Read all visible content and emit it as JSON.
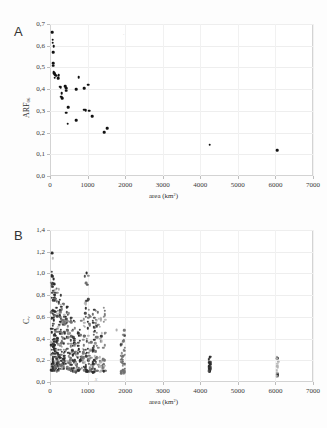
{
  "figure": {
    "background": "#fdfdfd",
    "panel_a_letter": "A",
    "panel_b_letter": "B"
  },
  "chart_data": [
    {
      "type": "scatter",
      "panel": "A",
      "title": "",
      "xlabel": "area (km²)",
      "ylabel": "ARF06",
      "ylabel_base": "ARF",
      "ylabel_sub": "06",
      "xlim": [
        0,
        7000
      ],
      "ylim": [
        0.0,
        0.7
      ],
      "xticks": [
        "0",
        "1000",
        "2000",
        "3000",
        "4000",
        "5000",
        "6000",
        "7000"
      ],
      "xtick_values": [
        0,
        1000,
        2000,
        3000,
        4000,
        5000,
        6000,
        7000
      ],
      "yticks": [
        "0,0",
        "0,1",
        "0,2",
        "0,3",
        "0,4",
        "0,5",
        "0,6",
        "0,7"
      ],
      "ytick_values": [
        0.0,
        0.1,
        0.2,
        0.3,
        0.4,
        0.5,
        0.6,
        0.7
      ],
      "grid": true,
      "legend": "none",
      "marker_color": "#111111",
      "marker_size_px": 2.6,
      "points": [
        {
          "x": 60,
          "y": 0.663
        },
        {
          "x": 70,
          "y": 0.627
        },
        {
          "x": 75,
          "y": 0.613
        },
        {
          "x": 95,
          "y": 0.597
        },
        {
          "x": 80,
          "y": 0.571
        },
        {
          "x": 85,
          "y": 0.519
        },
        {
          "x": 90,
          "y": 0.508
        },
        {
          "x": 95,
          "y": 0.478
        },
        {
          "x": 110,
          "y": 0.474
        },
        {
          "x": 130,
          "y": 0.47
        },
        {
          "x": 140,
          "y": 0.466
        },
        {
          "x": 160,
          "y": 0.462
        },
        {
          "x": 235,
          "y": 0.463
        },
        {
          "x": 120,
          "y": 0.452
        },
        {
          "x": 215,
          "y": 0.451
        },
        {
          "x": 255,
          "y": 0.411
        },
        {
          "x": 290,
          "y": 0.408
        },
        {
          "x": 400,
          "y": 0.414
        },
        {
          "x": 430,
          "y": 0.405
        },
        {
          "x": 310,
          "y": 0.381
        },
        {
          "x": 430,
          "y": 0.392
        },
        {
          "x": 300,
          "y": 0.366
        },
        {
          "x": 320,
          "y": 0.359
        },
        {
          "x": 760,
          "y": 0.455
        },
        {
          "x": 700,
          "y": 0.401
        },
        {
          "x": 1010,
          "y": 0.42
        },
        {
          "x": 915,
          "y": 0.403
        },
        {
          "x": 480,
          "y": 0.316
        },
        {
          "x": 430,
          "y": 0.292
        },
        {
          "x": 470,
          "y": 0.24
        },
        {
          "x": 700,
          "y": 0.258
        },
        {
          "x": 905,
          "y": 0.305
        },
        {
          "x": 950,
          "y": 0.303
        },
        {
          "x": 1045,
          "y": 0.301
        },
        {
          "x": 1130,
          "y": 0.275
        },
        {
          "x": 1530,
          "y": 0.221
        },
        {
          "x": 1435,
          "y": 0.202
        },
        {
          "x": 4250,
          "y": 0.145
        },
        {
          "x": 6050,
          "y": 0.119
        }
      ],
      "artifacts": [
        {
          "x": 1960,
          "y": 0.651,
          "glyph": "·"
        }
      ]
    },
    {
      "type": "scatter",
      "panel": "B",
      "title": "",
      "xlabel": "area (km²)",
      "ylabel": "Cv",
      "ylabel_base": "C",
      "ylabel_sub": "v",
      "xlim": [
        0,
        7000
      ],
      "ylim": [
        0.0,
        1.4
      ],
      "xticks": [
        "0",
        "1000",
        "2000",
        "3000",
        "4000",
        "5000",
        "6000",
        "7000"
      ],
      "xtick_values": [
        0,
        1000,
        2000,
        3000,
        4000,
        5000,
        6000,
        7000
      ],
      "yticks": [
        "0,0",
        "0,2",
        "0,4",
        "0,6",
        "0,8",
        "1,0",
        "1,2",
        "1,4"
      ],
      "ytick_values": [
        0.0,
        0.2,
        0.4,
        0.6,
        0.8,
        1.0,
        1.2,
        1.4
      ],
      "grid": true,
      "legend": "none",
      "marker_color_dark": "#2b2b2b",
      "marker_color_mid": "#707070",
      "marker_color_light": "#b0b0b0",
      "marker_size_px": 2.4,
      "clusters": [
        {
          "x_center": 60,
          "x_spread": 30,
          "y_min": 0.1,
          "y_max": 1.19,
          "n": 46,
          "shade": "dark"
        },
        {
          "x_center": 110,
          "x_spread": 45,
          "y_min": 0.12,
          "y_max": 0.95,
          "n": 52,
          "shade": "dark"
        },
        {
          "x_center": 175,
          "x_spread": 55,
          "y_min": 0.1,
          "y_max": 0.86,
          "n": 48,
          "shade": "mid"
        },
        {
          "x_center": 250,
          "x_spread": 60,
          "y_min": 0.11,
          "y_max": 0.8,
          "n": 44,
          "shade": "dark"
        },
        {
          "x_center": 330,
          "x_spread": 60,
          "y_min": 0.12,
          "y_max": 0.72,
          "n": 42,
          "shade": "mid"
        },
        {
          "x_center": 420,
          "x_spread": 65,
          "y_min": 0.11,
          "y_max": 0.73,
          "n": 40,
          "shade": "dark"
        },
        {
          "x_center": 510,
          "x_spread": 60,
          "y_min": 0.1,
          "y_max": 0.66,
          "n": 36,
          "shade": "mid"
        },
        {
          "x_center": 600,
          "x_spread": 55,
          "y_min": 0.09,
          "y_max": 0.6,
          "n": 32,
          "shade": "dark"
        },
        {
          "x_center": 690,
          "x_spread": 50,
          "y_min": 0.09,
          "y_max": 0.56,
          "n": 28,
          "shade": "mid"
        },
        {
          "x_center": 790,
          "x_spread": 45,
          "y_min": 0.1,
          "y_max": 0.52,
          "n": 24,
          "shade": "dark"
        },
        {
          "x_center": 880,
          "x_spread": 45,
          "y_min": 0.1,
          "y_max": 0.62,
          "n": 26,
          "shade": "mid"
        },
        {
          "x_center": 970,
          "x_spread": 50,
          "y_min": 0.09,
          "y_max": 1.0,
          "n": 34,
          "shade": "dark"
        },
        {
          "x_center": 1060,
          "x_spread": 45,
          "y_min": 0.1,
          "y_max": 0.7,
          "n": 28,
          "shade": "mid"
        },
        {
          "x_center": 1160,
          "x_spread": 45,
          "y_min": 0.09,
          "y_max": 0.72,
          "n": 30,
          "shade": "dark"
        },
        {
          "x_center": 1250,
          "x_spread": 45,
          "y_min": 0.1,
          "y_max": 0.66,
          "n": 28,
          "shade": "mid"
        },
        {
          "x_center": 1340,
          "x_spread": 40,
          "y_min": 0.09,
          "y_max": 0.6,
          "n": 24,
          "shade": "light"
        },
        {
          "x_center": 1440,
          "x_spread": 35,
          "y_min": 0.1,
          "y_max": 0.72,
          "n": 26,
          "shade": "mid"
        },
        {
          "x_center": 1940,
          "x_spread": 55,
          "y_min": 0.08,
          "y_max": 0.48,
          "n": 42,
          "shade": "mid"
        },
        {
          "x_center": 4250,
          "x_spread": 22,
          "y_min": 0.1,
          "y_max": 0.23,
          "n": 22,
          "shade": "dark"
        },
        {
          "x_center": 6050,
          "x_spread": 22,
          "y_min": 0.05,
          "y_max": 0.26,
          "n": 24,
          "shade": "light"
        }
      ],
      "outliers": [
        {
          "x": 65,
          "y": 1.19,
          "shade": "dark"
        },
        {
          "x": 975,
          "y": 1.0,
          "shade": "dark"
        },
        {
          "x": 955,
          "y": 0.91,
          "shade": "mid"
        },
        {
          "x": 95,
          "y": 0.95,
          "shade": "dark"
        },
        {
          "x": 100,
          "y": 0.9,
          "shade": "dark"
        },
        {
          "x": 175,
          "y": 0.86,
          "shade": "mid"
        },
        {
          "x": 1770,
          "y": 0.48,
          "shade": "light"
        }
      ],
      "stray_marks": [
        {
          "x": 1230,
          "y": 0.025,
          "glyph": "x"
        }
      ]
    }
  ]
}
